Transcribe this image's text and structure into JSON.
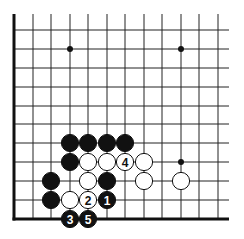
{
  "diagram": {
    "type": "go-board-fragment",
    "colors": {
      "background": "#ffffff",
      "grid": "#222222",
      "edge": "#111111",
      "black_stone": "#111111",
      "white_stone": "#ffffff"
    },
    "grid": {
      "columns_x": [
        14,
        33,
        51,
        70,
        88,
        107,
        125,
        144,
        162,
        181,
        199,
        218
      ],
      "rows_y": [
        30,
        49,
        68,
        87,
        106,
        124,
        143,
        162,
        181,
        200,
        219
      ],
      "top_y": 14,
      "right_x": 229,
      "left_edge_thick": true,
      "bottom_edge_thick": true
    },
    "star_points": [
      {
        "col": 3,
        "row": 1
      },
      {
        "col": 9,
        "row": 1
      },
      {
        "col": 9,
        "row": 7
      }
    ],
    "stones": [
      {
        "color": "black",
        "col": 3,
        "row": 6,
        "label": ""
      },
      {
        "color": "black",
        "col": 4,
        "row": 6,
        "label": ""
      },
      {
        "color": "black",
        "col": 5,
        "row": 6,
        "label": ""
      },
      {
        "color": "black",
        "col": 6,
        "row": 6,
        "label": ""
      },
      {
        "color": "black",
        "col": 3,
        "row": 7,
        "label": ""
      },
      {
        "color": "white",
        "col": 4,
        "row": 7,
        "label": ""
      },
      {
        "color": "white",
        "col": 5,
        "row": 7,
        "label": ""
      },
      {
        "color": "white",
        "col": 6,
        "row": 7,
        "label": "4"
      },
      {
        "color": "white",
        "col": 7,
        "row": 7,
        "label": ""
      },
      {
        "color": "black",
        "col": 2,
        "row": 8,
        "label": ""
      },
      {
        "color": "white",
        "col": 4,
        "row": 8,
        "label": ""
      },
      {
        "color": "black",
        "col": 5,
        "row": 8,
        "label": ""
      },
      {
        "color": "white",
        "col": 7,
        "row": 8,
        "label": ""
      },
      {
        "color": "white",
        "col": 9,
        "row": 8,
        "label": ""
      },
      {
        "color": "black",
        "col": 2,
        "row": 9,
        "label": ""
      },
      {
        "color": "white",
        "col": 3,
        "row": 9,
        "label": ""
      },
      {
        "color": "white",
        "col": 4,
        "row": 9,
        "label": "2"
      },
      {
        "color": "black",
        "col": 5,
        "row": 9,
        "label": "1"
      },
      {
        "color": "black",
        "col": 3,
        "row": 10,
        "label": "3"
      },
      {
        "color": "black",
        "col": 4,
        "row": 10,
        "label": "5"
      }
    ]
  }
}
